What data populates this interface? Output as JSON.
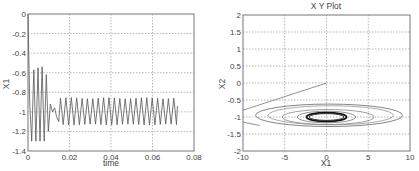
{
  "chart_data": [
    {
      "type": "line",
      "title": "",
      "xlabel": "time",
      "ylabel": "X1",
      "xlim": [
        0,
        0.08
      ],
      "ylim": [
        -1.4,
        0
      ],
      "xticks": [
        "0",
        "0.02",
        "0.04",
        "0.06",
        "0.08"
      ],
      "yticks": [
        "0",
        "-0.2",
        "-0.4",
        "-0.6",
        "-0.8",
        "-1",
        "-1.2",
        "-1.4"
      ],
      "grid": true,
      "series": [
        {
          "name": "X1",
          "description": "Starts at 0, drops sharply, large oscillations between about -0.55 and -1.3 until t≈0.011, then sustained oscillation between about -0.86 and -1.13 until t≈0.072",
          "x": [
            0,
            0.0008,
            0.0018,
            0.0028,
            0.0038,
            0.0048,
            0.0058,
            0.0068,
            0.0078,
            0.0088,
            0.0098,
            0.0108,
            0.0118,
            0.0128,
            0.0138,
            0.0148
          ],
          "y": [
            0,
            -0.9,
            -1.3,
            -0.57,
            -1.3,
            -0.55,
            -1.3,
            -0.54,
            -1.3,
            -0.62,
            -1.2,
            -0.92,
            -1.0,
            -0.96,
            -1.05,
            -1.1
          ]
        }
      ],
      "steady_oscillation": {
        "t_start": 0.015,
        "t_end": 0.072,
        "period": 0.0026,
        "max": -0.86,
        "min": -1.13
      }
    },
    {
      "type": "line",
      "title": "X Y Plot",
      "xlabel": "X1",
      "ylabel": "X2",
      "xlim": [
        -10,
        10
      ],
      "ylim": [
        -2,
        2
      ],
      "xticks": [
        "-10",
        "-5",
        "0",
        "5",
        "10"
      ],
      "yticks": [
        "2",
        "1.5",
        "1",
        "0.5",
        "0",
        "-0.5",
        "-1",
        "-1.5",
        "-2"
      ],
      "grid": true,
      "series": [
        {
          "name": "X1 vs X2 phase trajectory",
          "description": "Starts near (0,0), sweeps left to (-10,-0.8), then spirals in elliptical loops centered near (0,-1) converging to a small limit cycle x1∈[-2.5,2.5], x2∈[-1.15,-0.85]",
          "x": [
            0,
            -5,
            -10,
            -8,
            0,
            9,
            0,
            -7,
            -3,
            0,
            3,
            0,
            -2.5,
            0,
            2.5,
            0,
            -2.5
          ],
          "y": [
            0,
            -0.4,
            -0.8,
            -1.25,
            -1.3,
            -0.95,
            -0.6,
            -0.9,
            -1.2,
            -1.2,
            -1.0,
            -0.85,
            -1.05,
            -1.15,
            -0.95,
            -0.85,
            -1.05
          ]
        }
      ]
    }
  ]
}
